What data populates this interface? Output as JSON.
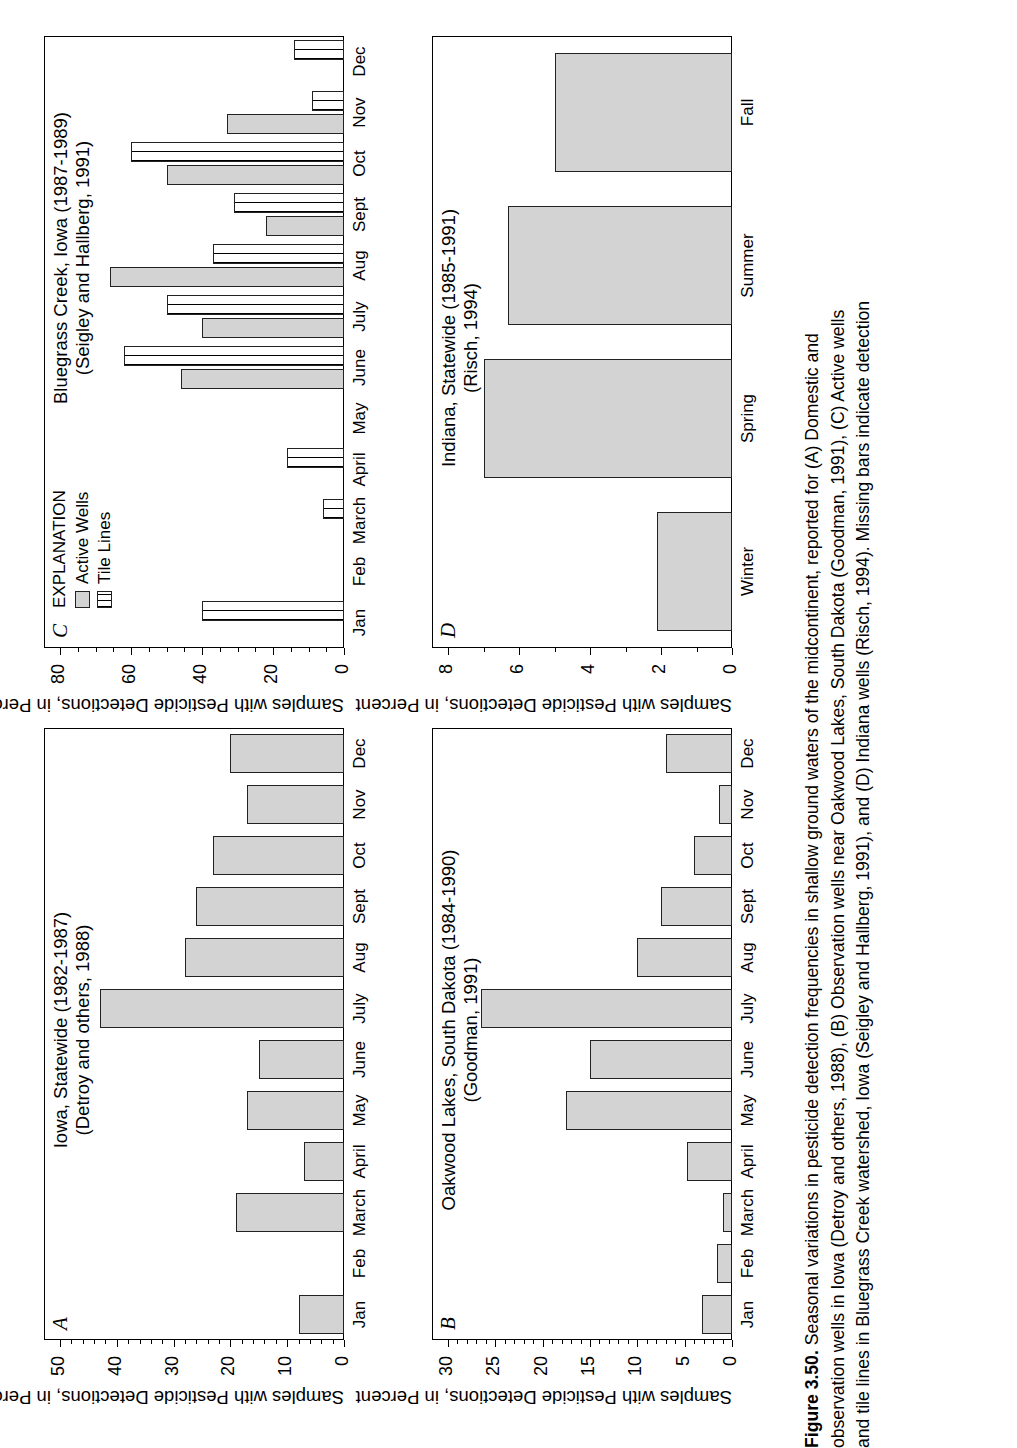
{
  "figure": {
    "number": "Figure 3.50.",
    "caption_line1": "Seasonal variations in pesticide detection frequencies in shallow ground waters of the midcontinent, reported for (A) Domestic and",
    "caption_line2": "observation wells in Iowa (Detroy and others, 1988), (B) Observation wells near Oakwood Lakes, South Dakota (Goodman, 1991), (C) Active wells",
    "caption_line3": "and tile lines in Bluegrass Creek watershed, Iowa (Seigley and Hallberg, 1991), and (D) Indiana wells (Risch, 1994). Missing bars indicate detection"
  },
  "shared": {
    "yaxis_title": "Samples with Pesticide Detections, in Percent",
    "months": [
      "Jan",
      "Feb",
      "March",
      "April",
      "May",
      "June",
      "July",
      "Aug",
      "Sept",
      "Oct",
      "Nov",
      "Dec"
    ],
    "seasons": [
      "Winter",
      "Spring",
      "Summer",
      "Fall"
    ]
  },
  "legend": {
    "title": "EXPLANATION",
    "items": [
      {
        "label": "Active Wells",
        "fill": "#d3d3d3"
      },
      {
        "label": "Tile Lines",
        "fill": "#ffffff"
      }
    ]
  },
  "chart_data": [
    {
      "type": "bar",
      "panel": "A",
      "title": "Iowa, Statewide (1982-1987)",
      "subtitle": "(Detroy and others, 1988)",
      "xlabel": "",
      "ylabel": "Samples with Pesticide Detections, in Percent",
      "categories": [
        "Jan",
        "Feb",
        "March",
        "April",
        "May",
        "June",
        "July",
        "Aug",
        "Sept",
        "Oct",
        "Nov",
        "Dec"
      ],
      "values": [
        8,
        0,
        19,
        7,
        17,
        15,
        43,
        28,
        26,
        23,
        17,
        20
      ],
      "ylim": [
        0,
        50
      ],
      "yticks": [
        0,
        10,
        20,
        30,
        40,
        50
      ],
      "grid": false,
      "legend_position": "none"
    },
    {
      "type": "bar",
      "panel": "B",
      "title": "Oakwood Lakes, South Dakota (1984-1990)",
      "subtitle": "(Goodman, 1991)",
      "xlabel": "",
      "ylabel": "Samples with Pesticide Detections, in Percent",
      "categories": [
        "Jan",
        "Feb",
        "March",
        "April",
        "May",
        "June",
        "July",
        "Aug",
        "Sept",
        "Oct",
        "Nov",
        "Dec"
      ],
      "values": [
        3.2,
        1.6,
        1.0,
        4.8,
        17.5,
        15.0,
        26.5,
        10.0,
        7.5,
        4.0,
        1.4,
        7.0
      ],
      "ylim": [
        0,
        30
      ],
      "yticks": [
        0,
        5,
        10,
        15,
        20,
        25,
        30
      ],
      "grid": false,
      "legend_position": "none"
    },
    {
      "type": "bar",
      "panel": "C",
      "title": "Bluegrass Creek, Iowa (1987-1989)",
      "subtitle": "(Seigley and Hallberg, 1991)",
      "xlabel": "",
      "ylabel": "Samples with Pesticide Detections, in Percent",
      "categories": [
        "Jan",
        "Feb",
        "March",
        "April",
        "May",
        "June",
        "July",
        "Aug",
        "Sept",
        "Oct",
        "Nov",
        "Dec"
      ],
      "series": [
        {
          "name": "Active Wells",
          "values": [
            0,
            0,
            0,
            0,
            0,
            46,
            40,
            66,
            22,
            50,
            33,
            0
          ]
        },
        {
          "name": "Tile Lines",
          "values": [
            40,
            0,
            6,
            16,
            0,
            62,
            50,
            37,
            31,
            60,
            9,
            14
          ]
        }
      ],
      "ylim": [
        0,
        80
      ],
      "yticks": [
        0,
        20,
        40,
        60,
        80
      ],
      "grid": false,
      "legend_position": "top-left"
    },
    {
      "type": "bar",
      "panel": "D",
      "title": "Indiana, Statewide (1985-1991)",
      "subtitle": "(Risch, 1994)",
      "xlabel": "",
      "ylabel": "Samples with Pesticide Detections, in Percent",
      "categories": [
        "Winter",
        "Spring",
        "Summer",
        "Fall"
      ],
      "values": [
        2.1,
        7.0,
        6.3,
        5.0
      ],
      "ylim": [
        0,
        8
      ],
      "yticks": [
        0,
        2,
        4,
        6,
        8
      ],
      "grid": false,
      "legend_position": "none"
    }
  ]
}
